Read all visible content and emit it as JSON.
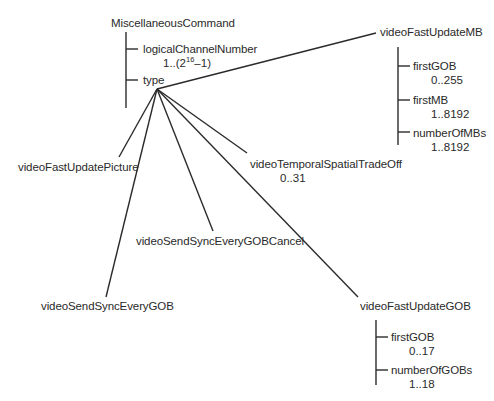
{
  "diagram": {
    "root": {
      "label": "MiscellaneousCommand",
      "fields": [
        {
          "label": "logicalChannelNumber",
          "range_prefix": "1..(2",
          "range_sup": "16",
          "range_suffix": "–1)"
        },
        {
          "label": "type"
        }
      ]
    },
    "type_choices": [
      {
        "label": "videoFastUpdateMB",
        "fields": [
          {
            "label": "firstGOB",
            "range": "0..255"
          },
          {
            "label": "firstMB",
            "range": "1..8192"
          },
          {
            "label": "numberOfMBs",
            "range": "1..8192"
          }
        ]
      },
      {
        "label": "videoFastUpdatePicture"
      },
      {
        "label": "videoTemporalSpatialTradeOff",
        "range": "0..31"
      },
      {
        "label": "videoSendSyncEveryGOBCancel"
      },
      {
        "label": "videoSendSyncEveryGOB"
      },
      {
        "label": "videoFastUpdateGOB",
        "fields": [
          {
            "label": "firstGOB",
            "range": "0..17"
          },
          {
            "label": "numberOfGOBs",
            "range": "1..18"
          }
        ]
      }
    ],
    "colors": {
      "line": "#2b2b2b",
      "text": "#2a2a2a",
      "background": "#ffffff"
    }
  }
}
